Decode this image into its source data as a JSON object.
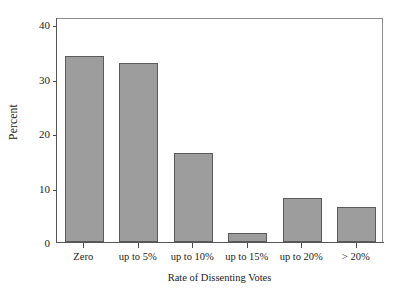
{
  "chart_data": {
    "type": "bar",
    "title": "",
    "xlabel": "Rate of Dissenting Votes",
    "ylabel": "Percent",
    "categories": [
      "Zero",
      "up to 5%",
      "up to 10%",
      "up to 15%",
      "up to 20%",
      "> 20%"
    ],
    "values": [
      34.1,
      32.8,
      16.3,
      1.7,
      8.1,
      6.4
    ],
    "ylim": [
      0,
      41.3
    ],
    "yticks": [
      0,
      10,
      20,
      30,
      40
    ],
    "ytick_labels": [
      "0",
      "10",
      "20",
      "30",
      "40"
    ],
    "xlim": [
      0,
      6
    ],
    "grid": false,
    "legend": false,
    "bar_color": "#9d9d9d",
    "bar_edge_color": "#5b5b5b",
    "axis_color": "#555555",
    "frame_color": "#8d8d8d",
    "background": "#ffffff",
    "bar_width_fraction": 0.72
  },
  "figure": {
    "plot_left_px": 56,
    "plot_top_px": 18,
    "plot_width_px": 327,
    "plot_height_px": 225
  }
}
